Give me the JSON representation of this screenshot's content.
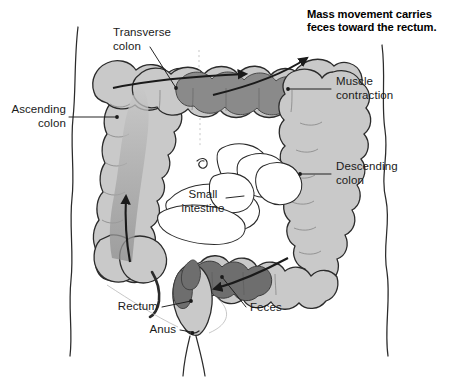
{
  "figure": {
    "type": "anatomical-illustration",
    "caption": "Mass movement carries\nfeces toward the rectum.",
    "background_color": "#ffffff",
    "ink_color": "#1a1a1a",
    "colon_fill_color": "#c9c9c9",
    "feces_fill_color": "#8a8a8a",
    "small_intestine_fill_color": "#ffffff"
  },
  "labels": {
    "transverse_colon": "Transverse\ncolon",
    "ascending_colon": "Ascending\ncolon",
    "muscle_contraction": "Muscle\ncontraction",
    "descending_colon": "Descending\ncolon",
    "small_intestine": "Small\nintestine",
    "rectum": "Rectum",
    "anus": "Anus",
    "feces": "Feces"
  }
}
